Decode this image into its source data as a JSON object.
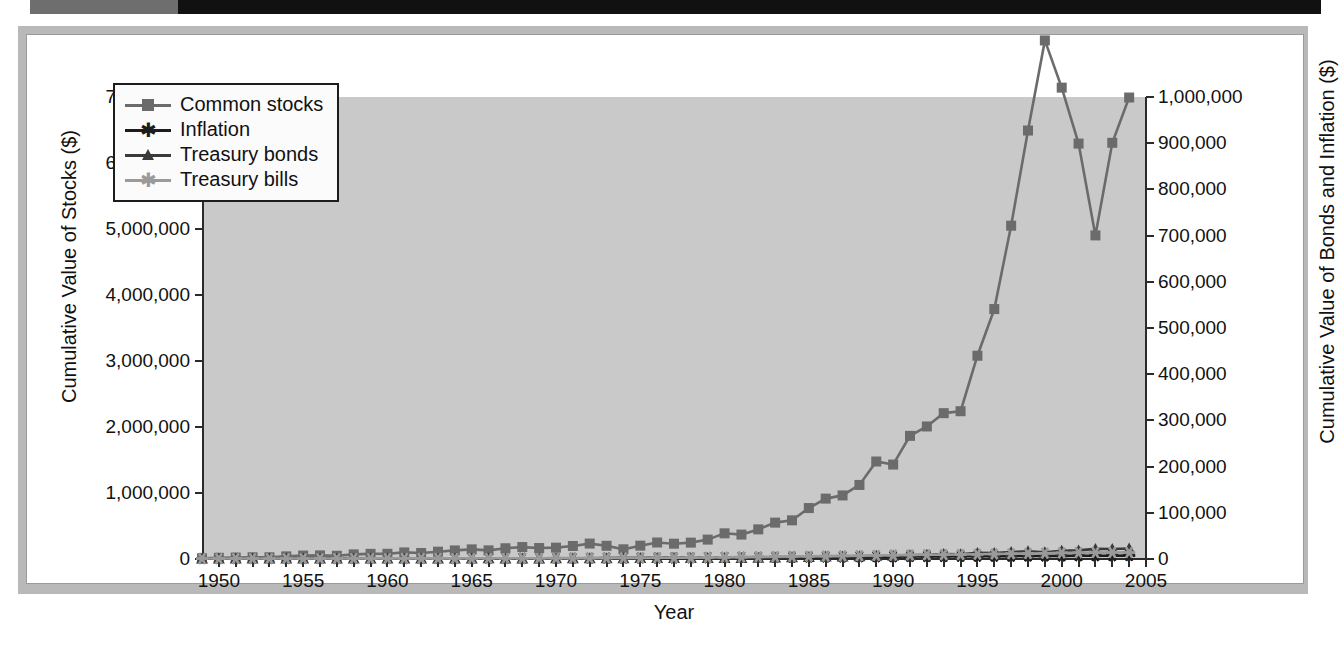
{
  "chart_data": {
    "type": "line",
    "title": "",
    "xlabel": "Year",
    "ylabel": "Cumulative Value of Stocks ($)",
    "ylabel_right": "Cumulative Value of Bonds and Inflation ($)",
    "xlim": [
      1949,
      2005
    ],
    "ylim": [
      0,
      7000000
    ],
    "ylim_right": [
      0,
      1000000
    ],
    "grid": false,
    "legend_position": "upper-left-inside",
    "x_tick_labels": [
      "1950",
      "1955",
      "1960",
      "1965",
      "1970",
      "1975",
      "1980",
      "1985",
      "1990",
      "1995",
      "2000",
      "2005"
    ],
    "x_tick_values": [
      1950,
      1955,
      1960,
      1965,
      1970,
      1975,
      1980,
      1985,
      1990,
      1995,
      2000,
      2005
    ],
    "x_minor_tick_step": 1,
    "y_tick_labels": [
      "0",
      "1,000,000",
      "2,000,000",
      "3,000,000",
      "4,000,000",
      "5,000,000",
      "6,000,000",
      "7,000,000"
    ],
    "y_tick_values": [
      0,
      1000000,
      2000000,
      3000000,
      4000000,
      5000000,
      6000000,
      7000000
    ],
    "y_right_tick_labels": [
      "0",
      "100,000",
      "200,000",
      "300,000",
      "400,000",
      "500,000",
      "600,000",
      "700,000",
      "800,000",
      "900,000",
      "1,000,000"
    ],
    "y_right_tick_values": [
      0,
      100000,
      200000,
      300000,
      400000,
      500000,
      600000,
      700000,
      800000,
      900000,
      1000000
    ],
    "x": [
      1949,
      1950,
      1951,
      1952,
      1953,
      1954,
      1955,
      1956,
      1957,
      1958,
      1959,
      1960,
      1961,
      1962,
      1963,
      1964,
      1965,
      1966,
      1967,
      1968,
      1969,
      1970,
      1971,
      1972,
      1973,
      1974,
      1975,
      1976,
      1977,
      1978,
      1979,
      1980,
      1981,
      1982,
      1983,
      1984,
      1985,
      1986,
      1987,
      1988,
      1989,
      1990,
      1991,
      1992,
      1993,
      1994,
      1995,
      1996,
      1997,
      1998,
      1999,
      2000,
      2001,
      2002,
      2003,
      2004
    ],
    "series": [
      {
        "name": "Common stocks",
        "axis": "left",
        "color": "#6b6b6b",
        "marker": "square",
        "values": [
          10000,
          18000,
          22000,
          26000,
          26000,
          40000,
          52000,
          55000,
          49000,
          70000,
          78000,
          79000,
          100000,
          91000,
          111000,
          130000,
          146000,
          131000,
          163000,
          181000,
          166000,
          172000,
          197000,
          234000,
          200000,
          147000,
          202000,
          250000,
          232000,
          248000,
          294000,
          389000,
          370000,
          449000,
          551000,
          586000,
          772000,
          915000,
          963000,
          1122000,
          1477000,
          1431000,
          1866000,
          2008000,
          2210000,
          2239000,
          3080000,
          3787000,
          5050000,
          6492000,
          7857000,
          7142000,
          6294000,
          4903000,
          6306000,
          6992000
        ]
      },
      {
        "name": "Inflation",
        "axis": "right",
        "color": "#1c1c1c",
        "marker": "star",
        "values": [
          1000,
          1012,
          1072,
          1082,
          1089,
          1084,
          1088,
          1120,
          1153,
          1174,
          1191,
          1208,
          1216,
          1231,
          1251,
          1266,
          1290,
          1333,
          1374,
          1438,
          1525,
          1609,
          1663,
          1720,
          1870,
          2035,
          2176,
          2281,
          2435,
          2654,
          2999,
          3370,
          3671,
          3811,
          3958,
          4110,
          4266,
          4313,
          4504,
          4701,
          4921,
          5224,
          5382,
          5537,
          5687,
          5840,
          5989,
          6189,
          6294,
          6397,
          6568,
          6788,
          6893,
          7059,
          7194,
          7433
        ]
      },
      {
        "name": "Treasury bonds",
        "axis": "right",
        "color": "#3a3a3a",
        "marker": "triangle",
        "values": [
          1000,
          1007,
          1004,
          1021,
          1056,
          1131,
          1115,
          1054,
          1135,
          1070,
          1045,
          1188,
          1199,
          1280,
          1295,
          1340,
          1331,
          1378,
          1288,
          1321,
          1254,
          1466,
          1657,
          1750,
          1770,
          1847,
          1992,
          2320,
          2300,
          2290,
          2281,
          2192,
          2250,
          2952,
          3071,
          3561,
          4480,
          5410,
          5270,
          5795,
          6800,
          6920,
          7920,
          8990,
          10640,
          10420,
          13100,
          12930,
          14950,
          16540,
          14510,
          17600,
          18610,
          21800,
          21590,
          22720
        ]
      },
      {
        "name": "Treasury bills",
        "axis": "right",
        "color": "#9a9a9a",
        "marker": "star",
        "values": [
          1000,
          1012,
          1027,
          1044,
          1063,
          1073,
          1090,
          1117,
          1152,
          1170,
          1205,
          1237,
          1264,
          1299,
          1340,
          1387,
          1441,
          1510,
          1574,
          1655,
          1763,
          1878,
          1959,
          2032,
          2175,
          2351,
          2488,
          2615,
          2748,
          2945,
          3254,
          3628,
          4168,
          4624,
          5030,
          5526,
          5958,
          6319,
          6666,
          7139,
          7733,
          8333,
          8802,
          9110,
          9374,
          9753,
          10292,
          10811,
          11375,
          11953,
          12517,
          13265,
          13732,
          13950,
          14080,
          14225
        ]
      }
    ]
  },
  "legend": {
    "items": [
      {
        "label": "Common stocks",
        "icon": "square-marker-icon"
      },
      {
        "label": "Inflation",
        "icon": "star-marker-icon"
      },
      {
        "label": "Treasury bonds",
        "icon": "triangle-marker-icon"
      },
      {
        "label": "Treasury bills",
        "icon": "star-marker-icon"
      }
    ]
  }
}
